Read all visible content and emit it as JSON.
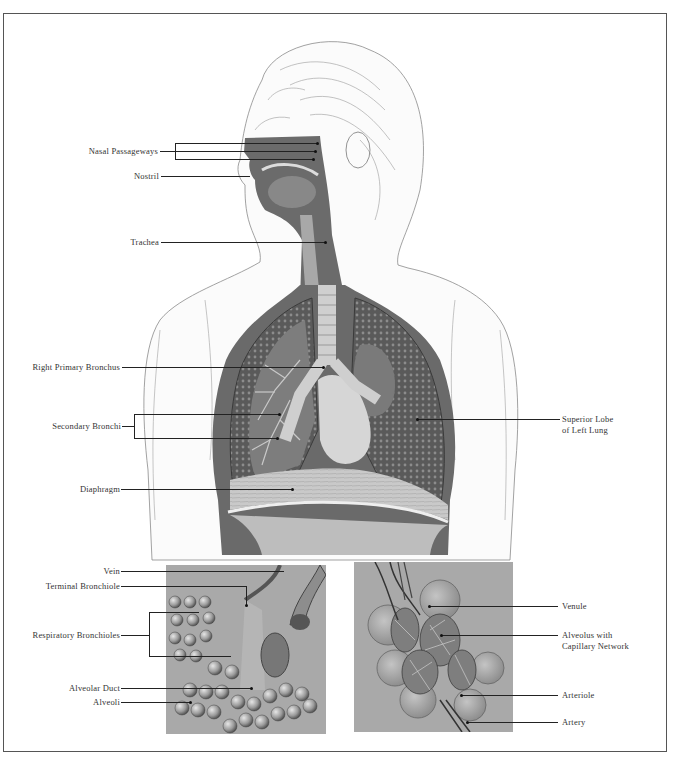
{
  "figure": {
    "main_labels": {
      "nasal_passageways": "Nasal Passageways",
      "nostril": "Nostril",
      "trachea": "Trachea",
      "right_primary_bronchus": "Right Primary Bronchus",
      "secondary_bronchi": "Secondary Bronchi",
      "diaphragm": "Diaphragm",
      "superior_lobe_line1": "Superior Lobe",
      "superior_lobe_line2": "of Left Lung"
    },
    "inset_left_labels": {
      "vein": "Vein",
      "terminal_bronchiole": "Terminal Bronchiole",
      "respiratory_bronchioles": "Respiratory Bronchioles",
      "alveolar_duct": "Alveolar Duct",
      "alveoli": "Alveoli"
    },
    "inset_right_labels": {
      "venule": "Venule",
      "alveolus_line1": "Alveolus with",
      "alveolus_line2": "Capillary Network",
      "arteriole": "Arteriole",
      "artery": "Artery"
    },
    "colors": {
      "tissue_dark": "#5e5e5e",
      "tissue_mid": "#8a8a8a",
      "inset_bg": "#a9a9a9",
      "line": "#222222"
    }
  }
}
